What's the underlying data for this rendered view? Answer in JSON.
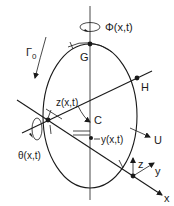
{
  "diagram": {
    "type": "vortex-ring-coordinate-schematic",
    "labels": {
      "circulation": "Γ",
      "circulation_subscript": "0",
      "twist": "Φ(x,t)",
      "top_point": "G",
      "side_point": "H",
      "center_point": "C",
      "vertical_displacement": "z(x,t)",
      "lateral_displacement": "y(x,t)",
      "rotation": "θ(x,t)",
      "velocity": "U",
      "axis_x": "x",
      "axis_y": "y",
      "axis_z": "z"
    },
    "colors": {
      "ink": "#1a1a1a",
      "background": "#ffffff"
    }
  }
}
